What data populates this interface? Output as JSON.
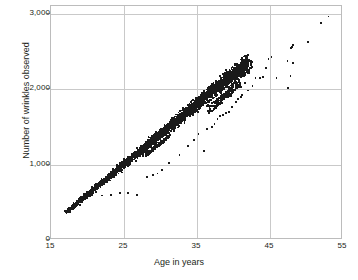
{
  "chart_data": {
    "type": "scatter",
    "title": "",
    "xlabel": "Age in years",
    "ylabel": "Number of wrinkles observed",
    "xlim": [
      15,
      55
    ],
    "ylim": [
      0,
      3100
    ],
    "xticks": [
      "15",
      "25",
      "35",
      "45",
      "55"
    ],
    "xtick_values": [
      15,
      25,
      35,
      45,
      55
    ],
    "yticks": [
      "0",
      "1,000",
      "2,000",
      "3,000"
    ],
    "ytick_values": [
      0,
      1000,
      2000,
      3000
    ],
    "grid": true,
    "legend": "none",
    "marker": "square",
    "marker_color": "#1a1a1a",
    "marker_size_px": 1.8,
    "trend": {
      "slope_per_year": 80,
      "intercept": -1000,
      "band_half_width": 90
    },
    "dense_band": {
      "x_start": 17,
      "x_end": 42,
      "n_points": 2600
    },
    "outliers": [
      [
        53.0,
        2960
      ],
      [
        52.0,
        2880
      ],
      [
        50.2,
        2620
      ],
      [
        48.2,
        2580
      ],
      [
        48.0,
        2560
      ],
      [
        47.9,
        2540
      ],
      [
        47.4,
        2370
      ],
      [
        48.2,
        2350
      ],
      [
        47.8,
        2170
      ],
      [
        47.5,
        2010
      ],
      [
        45.9,
        2150
      ],
      [
        45.2,
        2420
      ],
      [
        44.8,
        2400
      ],
      [
        44.4,
        2280
      ],
      [
        44.0,
        2160
      ],
      [
        43.6,
        2150
      ],
      [
        43.0,
        2150
      ],
      [
        42.6,
        2040
      ],
      [
        42.0,
        1980
      ],
      [
        41.6,
        2080
      ],
      [
        41.2,
        1920
      ],
      [
        41.0,
        1890
      ],
      [
        40.6,
        1870
      ],
      [
        40.3,
        1830
      ],
      [
        39.8,
        1760
      ],
      [
        39.4,
        1700
      ],
      [
        39.0,
        1680
      ],
      [
        38.6,
        1660
      ],
      [
        38.2,
        1640
      ],
      [
        37.8,
        1600
      ],
      [
        37.4,
        1540
      ],
      [
        37.0,
        1500
      ],
      [
        36.4,
        1470
      ],
      [
        36.0,
        1180
      ],
      [
        35.2,
        1400
      ],
      [
        34.6,
        1330
      ],
      [
        33.8,
        1250
      ],
      [
        32.6,
        1130
      ],
      [
        31.2,
        1020
      ],
      [
        30.2,
        930
      ],
      [
        29.6,
        880
      ],
      [
        29.0,
        860
      ],
      [
        28.2,
        830
      ],
      [
        26.8,
        600
      ],
      [
        25.6,
        620
      ],
      [
        24.4,
        620
      ],
      [
        23.2,
        600
      ],
      [
        22.0,
        590
      ]
    ]
  },
  "axis": {
    "ylabel": "Number of wrinkles observed",
    "xlabel": "Age in years",
    "y_ticks": [
      {
        "label": "3,000",
        "value": 3000
      },
      {
        "label": "2,000",
        "value": 2000
      },
      {
        "label": "1,000",
        "value": 1000
      },
      {
        "label": "0",
        "value": 0
      }
    ],
    "x_ticks": [
      {
        "label": "15",
        "value": 15
      },
      {
        "label": "25",
        "value": 25
      },
      {
        "label": "35",
        "value": 35
      },
      {
        "label": "45",
        "value": 45
      },
      {
        "label": "55",
        "value": 55
      }
    ]
  }
}
